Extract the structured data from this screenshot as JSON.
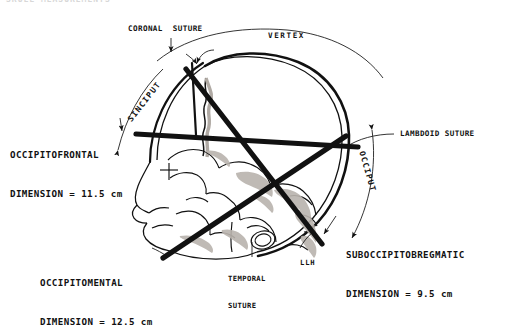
{
  "figure": {
    "cropped_title": "SKULL MEASUREMENTS",
    "background_color": "#ffffff",
    "ink_color": "#111111",
    "shading_color": "#b0aaa4"
  },
  "labels": {
    "coronal_suture": "CORONAL  SUTURE",
    "vertex": "VERTEX",
    "sinciput": "SINCIPUT",
    "occiput": "OCCIPUT",
    "lambdoid_suture": "LAMBDOID SUTURE",
    "temporal_suture_line1": "TEMPORAL",
    "temporal_suture_line2": "SUTURE",
    "llh": "LLH"
  },
  "dimensions": [
    {
      "id": "occipitofrontal",
      "name_line": "OCCIPITOFRONTAL",
      "value_line": "DIMENSION = 11.5 cm",
      "value": 11.5,
      "unit": "cm"
    },
    {
      "id": "occipitomental",
      "name_line": "OCCIPITOMENTAL",
      "value_line": "DIMENSION = 12.5 cm",
      "value": 12.5,
      "unit": "cm"
    },
    {
      "id": "suboccipitobregmatic",
      "name_line": "SUBOCCIPITOBREGMATIC",
      "value_line": "DIMENSION = 9.5 cm",
      "value": 9.5,
      "unit": "cm"
    }
  ]
}
